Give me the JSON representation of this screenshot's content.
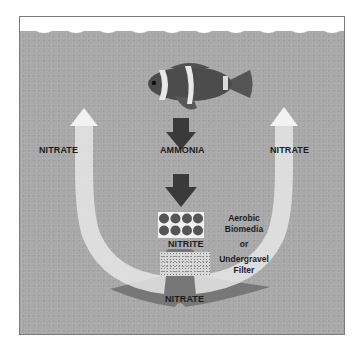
{
  "diagram": {
    "type": "nitrogen-cycle",
    "labels": {
      "ammonia": "AMMONIA",
      "nitrite": "NITRITE",
      "nitrate_left": "NITRATE",
      "nitrate_right": "NITRATE",
      "nitrate_bottom": "NITRATE"
    },
    "filter_text": {
      "line1": "Aerobic",
      "line2": "Biomedia",
      "line3": "or",
      "line4": "Undergravel",
      "line5": "Filter"
    },
    "icons": {
      "fish": "clownfish-icon",
      "down_arrow": "down-arrow-icon",
      "up_arrow": "curved-up-arrow-icon"
    },
    "colors": {
      "water": "#a9a9a9",
      "arrow_dark": "#3a3a3a",
      "arrow_light": "#e8e8e8",
      "text": "#1c1c1c"
    }
  }
}
